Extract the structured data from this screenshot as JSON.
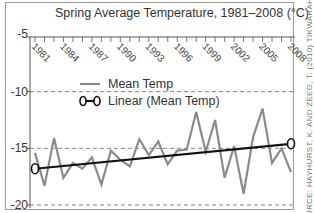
{
  "chart_data": {
    "type": "line",
    "title": "Spring Average Temperature, 1981–2008 (°C)",
    "xlabel": "",
    "ylabel": "",
    "ylim": [
      -20,
      -5
    ],
    "yticks": [
      "-5",
      "-10",
      "-15",
      "-20"
    ],
    "xtick_labels": [
      "1981",
      "1984",
      "1987",
      "1990",
      "1993",
      "1996",
      "1999",
      "2002",
      "2005",
      "2008"
    ],
    "grid": "dashed horizontal at -10, -15, -20",
    "legend_position": "upper left inside plot",
    "x": [
      1981,
      1982,
      1983,
      1984,
      1985,
      1986,
      1987,
      1988,
      1989,
      1990,
      1991,
      1992,
      1993,
      1994,
      1995,
      1996,
      1997,
      1998,
      1999,
      2000,
      2001,
      2002,
      2003,
      2004,
      2005,
      2006,
      2007,
      2008
    ],
    "series": [
      {
        "name": "Mean Temp",
        "color": "#8a8a8a",
        "values": [
          -15.4,
          -18.3,
          -14.1,
          -17.6,
          -16.3,
          -16.8,
          -15.8,
          -18.2,
          -15.2,
          -16.0,
          -16.6,
          -14.2,
          -15.6,
          -14.4,
          -16.4,
          -15.2,
          -15.1,
          -11.8,
          -15.3,
          -12.5,
          -17.6,
          -14.8,
          -19.0,
          -14.0,
          -11.5,
          -16.3,
          -15.0,
          -17.1
        ]
      },
      {
        "name": "Linear (Mean Temp)",
        "color": "#111111",
        "values_endpoints": {
          "1981": -16.8,
          "2008": -14.6
        }
      }
    ]
  },
  "side_credit": "SOURCE: HAYHURST, K. AND ZEEG, T. (2010) TIKWARAHAG"
}
